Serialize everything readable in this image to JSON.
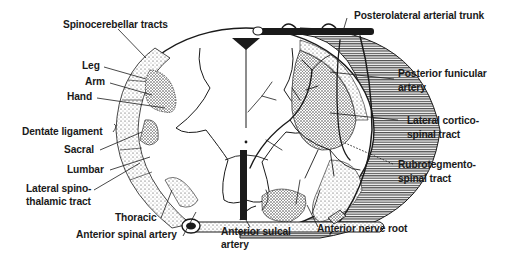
{
  "diagram": {
    "type": "anatomical cross-section",
    "colors": {
      "ink": "#1a1a1a",
      "background": "#ffffff",
      "stipple": "#555555"
    }
  },
  "labels": {
    "left": {
      "spinocerebellar": "Spinocerebellar tracts",
      "leg": "Leg",
      "arm": "Arm",
      "hand": "Hand",
      "dentate": "Dentate ligament",
      "sacral": "Sacral",
      "lumbar": "Lumbar",
      "lst_1": "Lateral spino-",
      "lst_2": "thalamic tract",
      "thoracic": "Thoracic",
      "anterior_spinal": "Anterior spinal artery"
    },
    "bottom": {
      "sulcal_1": "Anterior sulcal",
      "sulcal_2": "artery",
      "nerve_root": "Anterior nerve root"
    },
    "right": {
      "trunk": "Posterolateral arterial trunk",
      "funicular_1": "Posterior funicular",
      "funicular_2": "artery",
      "lct_1": "Lateral cortico-",
      "lct_2": "spinal tract",
      "rubro_1": "Rubrotegmento-",
      "rubro_2": "spinal tract"
    }
  }
}
